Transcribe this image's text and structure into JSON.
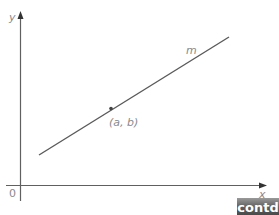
{
  "diagram": {
    "axes": {
      "x_label": "x",
      "y_label": "y",
      "origin_label": "0",
      "color": "#555555"
    },
    "line": {
      "label": "m",
      "color": "#555555"
    },
    "point": {
      "label": "(a, b)",
      "color": "#444444"
    }
  },
  "badge": {
    "label": "contd"
  }
}
